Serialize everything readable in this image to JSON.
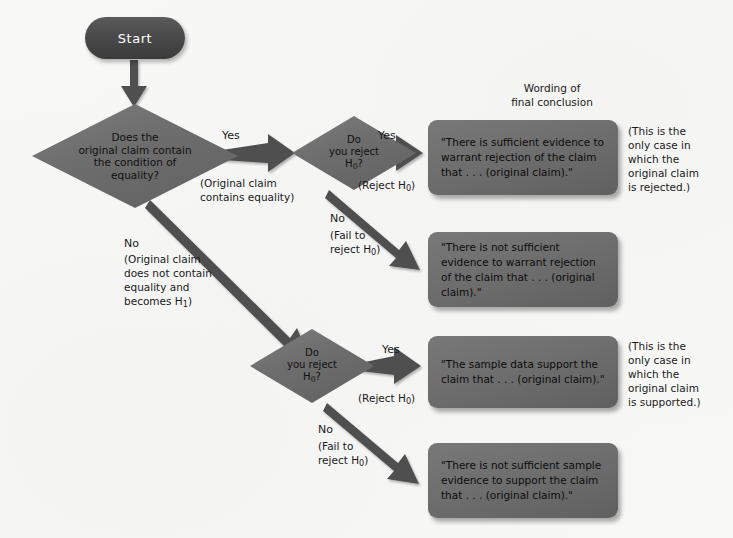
{
  "figure": {
    "type": "flowchart",
    "title_note": "Wording of\nfinal conclusion",
    "background_color": "#f8f8f7",
    "shape_fill": "#6e6e6e",
    "terminator_fill": "#4a4a4a",
    "terminator_text_color": "#ffffff",
    "shape_text_color": "#101010"
  },
  "nodes": {
    "start": {
      "label": "Start",
      "shape": "terminator"
    },
    "decision_equality": {
      "shape": "diamond",
      "line1": "Does the",
      "line2": "original claim contain",
      "line3": "the condition of",
      "line4": "equality?"
    },
    "decision_reject_top": {
      "shape": "diamond",
      "line1": "Do",
      "line2": "you reject",
      "line3": "H",
      "sub": "0",
      "line3b": "?"
    },
    "decision_reject_bottom": {
      "shape": "diamond",
      "line1": "Do",
      "line2": "you reject",
      "line3": "H",
      "sub": "0",
      "line3b": "?"
    }
  },
  "branches": {
    "yes_equality": {
      "label": "Yes",
      "note": "(Original claim\ncontains equality)"
    },
    "no_equality": {
      "label": "No",
      "note": "(Original claim\ndoes not contain\nequality and\nbecomes H",
      "note_sub": "1",
      "note_end": ")"
    },
    "top_yes": {
      "label": "Yes",
      "note_prefix": "(Reject H",
      "note_sub": "0",
      "note_suffix": ")"
    },
    "top_no": {
      "label": "No",
      "note_line1": "(Fail to",
      "note_line2": "reject H",
      "note_sub": "0",
      "note_suffix": ")"
    },
    "bottom_yes": {
      "label": "Yes",
      "note_prefix": "(Reject H",
      "note_sub": "0",
      "note_suffix": ")"
    },
    "bottom_no": {
      "label": "No",
      "note_line1": "(Fail to",
      "note_line2": "reject H",
      "note_sub": "0",
      "note_suffix": ")"
    }
  },
  "conclusions": [
    {
      "id": "sufficient-reject",
      "text": "\"There is sufficient\nevidence to warrant\nrejection of the claim\nthat . . . (original claim).\"",
      "annotation": "(This is the\nonly case in\nwhich the\noriginal claim\nis rejected.)"
    },
    {
      "id": "not-sufficient-reject",
      "text": "\"There is not sufficient\nevidence to warrant\nrejection of the claim\nthat . . . (original claim).\"",
      "annotation": ""
    },
    {
      "id": "sample-supports",
      "text": "\"The sample data\nsupport the claim\nthat . . . (original claim).\"",
      "annotation": "(This is the\nonly case in\nwhich the\noriginal claim\nis supported.)"
    },
    {
      "id": "not-sufficient-support",
      "text": "\"There is not sufficient\nsample evidence to\nsupport the claim\nthat . . . (original claim).\"",
      "annotation": ""
    }
  ]
}
